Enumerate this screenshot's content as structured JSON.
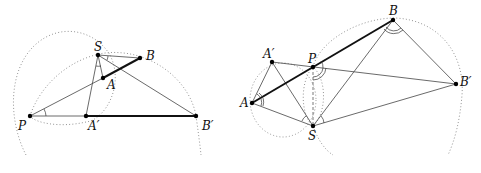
{
  "figures": [
    {
      "id": "left",
      "points": {
        "S": {
          "label": "S",
          "x": 98,
          "y": 55
        },
        "B": {
          "label": "B",
          "x": 140,
          "y": 58
        },
        "A": {
          "label": "A",
          "x": 103,
          "y": 78
        },
        "P": {
          "label": "P",
          "x": 30,
          "y": 116
        },
        "A_prime": {
          "label": "A′",
          "x": 86,
          "y": 116
        },
        "B_prime": {
          "label": "B′",
          "x": 196,
          "y": 116
        }
      }
    },
    {
      "id": "right",
      "points": {
        "B": {
          "label": "B",
          "x": 393,
          "y": 20
        },
        "A_prime": {
          "label": "A′",
          "x": 272,
          "y": 62
        },
        "P": {
          "label": "P",
          "x": 313,
          "y": 67
        },
        "B_prime": {
          "label": "B′",
          "x": 456,
          "y": 84
        },
        "A": {
          "label": "A",
          "x": 252,
          "y": 103
        },
        "S": {
          "label": "S",
          "x": 313,
          "y": 126
        }
      }
    }
  ]
}
